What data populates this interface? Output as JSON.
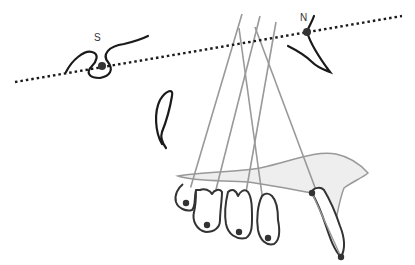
{
  "diagram": {
    "type": "cephalometric-tracing",
    "labels": {
      "sella": "S",
      "nasion": "N"
    },
    "colors": {
      "outline": "#1a1a1a",
      "reference_lines": "#999999",
      "maxilla_fill": "#eeeeee",
      "landmark": "#333333"
    },
    "reference_line": {
      "name": "SN line",
      "style": "dotted",
      "from": [
        15,
        82
      ],
      "to": [
        402,
        16
      ]
    },
    "landmarks": [
      {
        "name": "S",
        "x": 102,
        "y": 66
      },
      {
        "name": "N",
        "x": 307,
        "y": 32
      },
      {
        "name": "incisor-crown-tip",
        "x": 312,
        "y": 193
      },
      {
        "name": "incisor-apex",
        "x": 341,
        "y": 257
      },
      {
        "name": "tooth-1",
        "x": 186,
        "y": 203
      },
      {
        "name": "tooth-2",
        "x": 207,
        "y": 225
      },
      {
        "name": "tooth-3",
        "x": 239,
        "y": 232
      },
      {
        "name": "tooth-4",
        "x": 268,
        "y": 238
      }
    ],
    "tooth_axes_count": 5
  }
}
